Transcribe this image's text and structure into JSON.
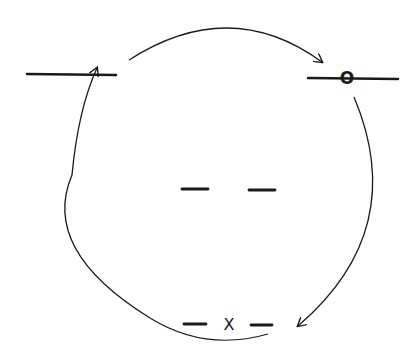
{
  "diagram": {
    "type": "cycle-diagram",
    "stroke_color": "#1a1a1a",
    "background": "#ffffff",
    "nodes": [
      {
        "id": "top-left-line",
        "shape": "horizontal-line",
        "label": ""
      },
      {
        "id": "top-right-line",
        "shape": "horizontal-line-with-marker",
        "label": "O"
      },
      {
        "id": "center-dashes",
        "shape": "two-short-dashes",
        "label": ""
      },
      {
        "id": "bottom-dashes",
        "shape": "two-short-dashes-with-marker",
        "label": "X"
      }
    ],
    "arrows": [
      {
        "from": "top-left-line",
        "to": "top-right-line",
        "direction": "clockwise"
      },
      {
        "from": "top-right-line",
        "to": "bottom-dashes",
        "direction": "clockwise"
      },
      {
        "from": "bottom-dashes",
        "to": "top-left-line",
        "direction": "clockwise"
      }
    ],
    "labels": {
      "top_right_marker": "O",
      "bottom_marker": "X"
    }
  }
}
